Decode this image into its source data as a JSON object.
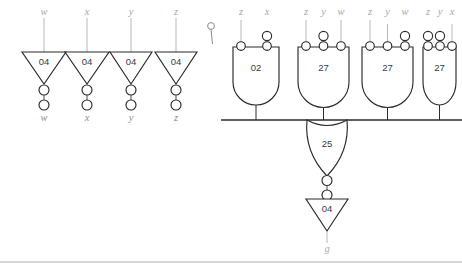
{
  "diagram": {
    "output_signal": "g",
    "colors": {
      "gate_stroke": "#2b2b2b",
      "wire": "#4c4c4c",
      "label": "#a8a8a8",
      "background": "#ffffff",
      "rule": "#c9c9c9"
    }
  },
  "inverters": [
    {
      "id": "inv-w",
      "type": "04",
      "input_label": "w",
      "output_label": "w"
    },
    {
      "id": "inv-x",
      "type": "04",
      "input_label": "x",
      "output_label": "x"
    },
    {
      "id": "inv-y",
      "type": "04",
      "input_label": "y",
      "output_label": "y"
    },
    {
      "id": "inv-z",
      "type": "04",
      "input_label": "z",
      "output_label": "z"
    }
  ],
  "gates": [
    {
      "id": "gate-02",
      "type": "02",
      "inputs": [
        {
          "label": "z",
          "dot": false
        },
        {
          "label": "x",
          "dot": true
        }
      ]
    },
    {
      "id": "gate-27-a",
      "type": "27",
      "inputs": [
        {
          "label": "z",
          "dot": false
        },
        {
          "label": "y",
          "dot": true
        },
        {
          "label": "w",
          "dot": false
        }
      ]
    },
    {
      "id": "gate-27-b",
      "type": "27",
      "inputs": [
        {
          "label": "z",
          "dot": false
        },
        {
          "label": "y",
          "dot": false
        },
        {
          "label": "w",
          "dot": true
        }
      ]
    },
    {
      "id": "gate-27-c",
      "type": "27",
      "inputs": [
        {
          "label": "z",
          "dot": true
        },
        {
          "label": "y",
          "dot": true
        },
        {
          "label": "x",
          "dot": false
        }
      ]
    }
  ],
  "or_gate": {
    "id": "gate-25",
    "type": "25"
  },
  "output_inverter": {
    "id": "inv-out",
    "type": "04",
    "output_label": "g"
  },
  "probe": {
    "id": "probe-marker",
    "label": ""
  }
}
